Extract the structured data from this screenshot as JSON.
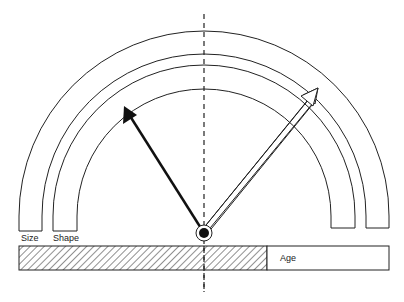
{
  "diagram": {
    "labels": {
      "size": "Size",
      "shape": "Shape",
      "age": "Age"
    },
    "arcs": [
      {
        "name": "size-band-outer",
        "radius": 185
      },
      {
        "name": "size-band-inner",
        "radius": 162
      },
      {
        "name": "shape-band-outer",
        "radius": 151
      },
      {
        "name": "shape-band-inner",
        "radius": 127
      }
    ],
    "pivot": {
      "x": 204,
      "y": 233
    },
    "arrows": [
      {
        "name": "solid-arrow",
        "style": "filled",
        "tip": [
          124,
          106
        ]
      },
      {
        "name": "hollow-arrow",
        "style": "hollow",
        "tip": [
          318,
          88
        ]
      }
    ],
    "age_bar": {
      "x_start": 19,
      "x_hatch_end": 267,
      "x_end": 389,
      "y_top": 246,
      "y_bottom": 270
    },
    "colors": {
      "line": "#222222",
      "background": "#ffffff"
    }
  }
}
